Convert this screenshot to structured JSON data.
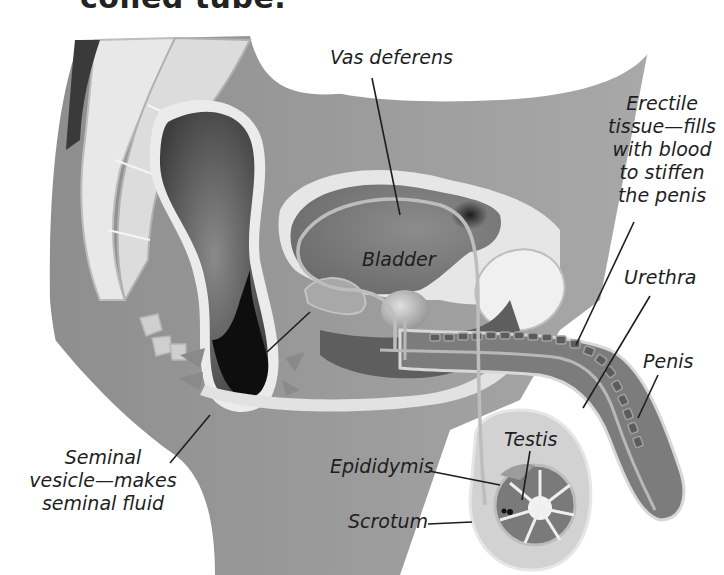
{
  "header": {
    "clipped_caption": "coiled tube."
  },
  "diagram": {
    "style": "grayscale anatomical illustration",
    "labels": {
      "vas_deferens": "Vas deferens",
      "erectile_tissue": [
        "Erectile",
        "tissue—fills",
        "with blood",
        "to stiffen",
        "the penis"
      ],
      "bladder": "Bladder",
      "urethra": "Urethra",
      "penis": "Penis",
      "seminal_vesicle": [
        "Seminal",
        "vesicle—makes",
        "seminal fluid"
      ],
      "testis": "Testis",
      "epididymis": "Epididymis",
      "scrotum": "Scrotum"
    },
    "colors": {
      "background": "#ffffff",
      "body": "#9a9a9a",
      "body_light": "#c8c8c8",
      "tissue_light": "#e4e4e4",
      "organ_dark": "#6e6e6e",
      "rectum_dark": "#141414",
      "label_text": "#1e1e1e",
      "leader_line": "#1e1e1e"
    }
  }
}
